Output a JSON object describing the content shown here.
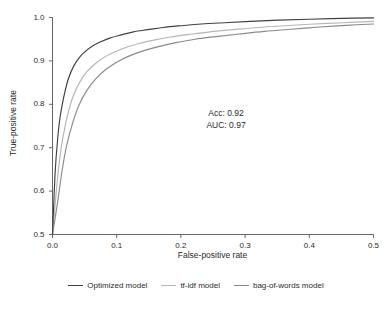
{
  "chart_data": {
    "type": "line",
    "title": "",
    "subtitle": "",
    "xlabel": "False-positive rate",
    "ylabel": "True-positive rate",
    "xlim": [
      0.0,
      0.5
    ],
    "ylim": [
      0.5,
      1.0
    ],
    "grid": false,
    "legend_position": "bottom-outside",
    "xticks": [
      "0.0",
      "0.1",
      "0.2",
      "0.3",
      "0.4",
      "0.5"
    ],
    "xtick_values": [
      0.0,
      0.1,
      0.2,
      0.3,
      0.4,
      0.5
    ],
    "yticks": [
      "0.5",
      "0.6",
      "0.7",
      "0.8",
      "0.9",
      "1.0"
    ],
    "ytick_values": [
      0.5,
      0.6,
      0.7,
      0.8,
      0.9,
      1.0
    ],
    "annotations": [
      {
        "text": "Acc: 0.92",
        "x": 0.225,
        "y": 0.795
      },
      {
        "text": "AUC: 0.97",
        "x": 0.225,
        "y": 0.765
      }
    ],
    "series": [
      {
        "name": "Optimized model",
        "color": "#404040",
        "x": [
          0.0,
          0.004,
          0.008,
          0.012,
          0.018,
          0.025,
          0.033,
          0.042,
          0.052,
          0.063,
          0.075,
          0.09,
          0.107,
          0.126,
          0.148,
          0.172,
          0.2,
          0.232,
          0.268,
          0.308,
          0.352,
          0.4,
          0.45,
          0.5
        ],
        "y": [
          0.5,
          0.64,
          0.72,
          0.772,
          0.82,
          0.86,
          0.888,
          0.908,
          0.923,
          0.935,
          0.944,
          0.953,
          0.96,
          0.967,
          0.972,
          0.977,
          0.981,
          0.985,
          0.988,
          0.991,
          0.994,
          0.996,
          0.998,
          0.999
        ]
      },
      {
        "name": "tf-idf model",
        "color": "#b5b5b5",
        "x": [
          0.0,
          0.006,
          0.011,
          0.017,
          0.024,
          0.032,
          0.042,
          0.053,
          0.066,
          0.08,
          0.096,
          0.114,
          0.135,
          0.158,
          0.184,
          0.213,
          0.245,
          0.281,
          0.32,
          0.362,
          0.408,
          0.452,
          0.5
        ],
        "y": [
          0.5,
          0.6,
          0.672,
          0.73,
          0.778,
          0.818,
          0.85,
          0.874,
          0.893,
          0.908,
          0.92,
          0.931,
          0.94,
          0.948,
          0.955,
          0.961,
          0.967,
          0.972,
          0.977,
          0.981,
          0.985,
          0.988,
          0.991
        ]
      },
      {
        "name": "bag-of-words model",
        "color": "#8a8a8a",
        "x": [
          0.0,
          0.008,
          0.015,
          0.022,
          0.031,
          0.041,
          0.053,
          0.067,
          0.082,
          0.1,
          0.119,
          0.141,
          0.165,
          0.192,
          0.222,
          0.255,
          0.291,
          0.33,
          0.372,
          0.416,
          0.458,
          0.5
        ],
        "y": [
          0.5,
          0.575,
          0.648,
          0.705,
          0.755,
          0.797,
          0.831,
          0.858,
          0.879,
          0.897,
          0.911,
          0.923,
          0.933,
          0.942,
          0.95,
          0.956,
          0.962,
          0.968,
          0.973,
          0.978,
          0.982,
          0.985
        ]
      }
    ]
  },
  "axes": {
    "x_title": "False-positive rate",
    "y_title": "True-positive rate"
  },
  "annotation": {
    "accuracy": "Acc: 0.92",
    "auc": "AUC: 0.97"
  },
  "legend": {
    "items": [
      {
        "label": "Optimized model",
        "color": "#404040"
      },
      {
        "label": "tf-idf model",
        "color": "#b5b5b5"
      },
      {
        "label": "bag-of-words model",
        "color": "#8a8a8a"
      }
    ]
  },
  "caption": {
    "text": ""
  }
}
